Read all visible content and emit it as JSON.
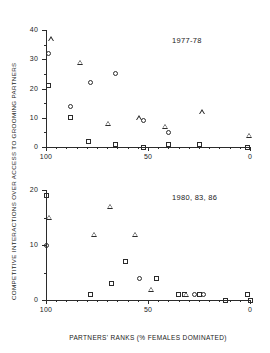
{
  "figure": {
    "xlabel": "PARTNERS' RANKS  (% FEMALES DOMINATED)",
    "ylabel": "COMPETITIVE INTERACTIONS OVER ACCESS TO GROOMING PARTNERS"
  },
  "chart_data": [
    {
      "type": "scatter",
      "title": "1977-78",
      "panel": "top",
      "xlabel": "PARTNERS' RANKS  (% FEMALES DOMINATED)",
      "ylabel": "COMPETITIVE INTERACTIONS OVER ACCESS TO GROOMING PARTNERS",
      "xlim": [
        100,
        0
      ],
      "ylim": [
        0,
        40
      ],
      "x_reversed": true,
      "xticks": [
        100,
        50,
        0
      ],
      "xticklabels": [
        "100",
        "50",
        "0"
      ],
      "yticks": [
        0,
        10,
        20,
        30,
        40
      ],
      "yticklabels": [
        "0",
        "10",
        "20",
        "30",
        "40"
      ],
      "y_minor_ticks": [
        5,
        15,
        25,
        35
      ],
      "grid": false,
      "legend": "none",
      "series": [
        {
          "name": "triangle",
          "marker": "triangle",
          "points": [
            {
              "x": 99,
              "y": 37
            },
            {
              "x": 85,
              "y": 29
            },
            {
              "x": 71,
              "y": 8
            },
            {
              "x": 56,
              "y": 10
            },
            {
              "x": 43,
              "y": 7
            },
            {
              "x": 25,
              "y": 12
            },
            {
              "x": 2,
              "y": 4
            }
          ]
        },
        {
          "name": "circle",
          "marker": "circle",
          "points": [
            {
              "x": 99,
              "y": 32
            },
            {
              "x": 88,
              "y": 14
            },
            {
              "x": 78,
              "y": 22
            },
            {
              "x": 66,
              "y": 25
            },
            {
              "x": 52,
              "y": 9
            },
            {
              "x": 40,
              "y": 5
            }
          ]
        },
        {
          "name": "square",
          "marker": "square",
          "points": [
            {
              "x": 99,
              "y": 21
            },
            {
              "x": 88,
              "y": 10
            },
            {
              "x": 79,
              "y": 2
            },
            {
              "x": 66,
              "y": 1
            },
            {
              "x": 52,
              "y": 0
            },
            {
              "x": 40,
              "y": 1
            },
            {
              "x": 25,
              "y": 1
            },
            {
              "x": 1,
              "y": 0
            }
          ]
        }
      ]
    },
    {
      "type": "scatter",
      "title": "1980, 83, 86",
      "panel": "bottom",
      "xlabel": "PARTNERS' RANKS  (% FEMALES DOMINATED)",
      "ylabel": "COMPETITIVE INTERACTIONS OVER ACCESS TO GROOMING PARTNERS",
      "xlim": [
        100,
        0
      ],
      "ylim": [
        0,
        20
      ],
      "x_reversed": true,
      "xticks": [
        100,
        50,
        0
      ],
      "xticklabels": [
        "100",
        "50",
        "0"
      ],
      "yticks": [
        0,
        10,
        20
      ],
      "yticklabels": [
        "0",
        "10",
        "20"
      ],
      "y_minor_ticks": [
        5,
        15
      ],
      "grid": false,
      "legend": "none",
      "series": [
        {
          "name": "square",
          "marker": "square",
          "points": [
            {
              "x": 100,
              "y": 19
            },
            {
              "x": 78,
              "y": 1
            },
            {
              "x": 68,
              "y": 3
            },
            {
              "x": 61,
              "y": 7
            },
            {
              "x": 46,
              "y": 4
            },
            {
              "x": 35,
              "y": 1
            },
            {
              "x": 32,
              "y": 1
            },
            {
              "x": 25,
              "y": 1
            },
            {
              "x": 12,
              "y": 0
            },
            {
              "x": 1,
              "y": 1
            },
            {
              "x": 0,
              "y": 0
            }
          ]
        },
        {
          "name": "triangle",
          "marker": "triangle",
          "points": [
            {
              "x": 100,
              "y": 15
            },
            {
              "x": 78,
              "y": 12
            },
            {
              "x": 70,
              "y": 17
            },
            {
              "x": 58,
              "y": 12
            },
            {
              "x": 50,
              "y": 2
            },
            {
              "x": 33,
              "y": 1
            }
          ]
        },
        {
          "name": "circle",
          "marker": "circle",
          "points": [
            {
              "x": 100,
              "y": 10
            },
            {
              "x": 54,
              "y": 4
            },
            {
              "x": 27,
              "y": 1
            },
            {
              "x": 23,
              "y": 1
            }
          ]
        }
      ]
    }
  ]
}
